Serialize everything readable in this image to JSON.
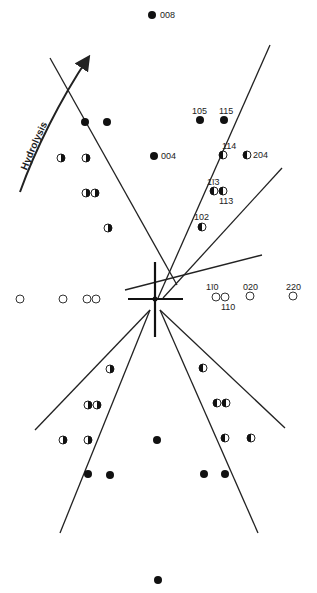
{
  "hydrolysis_label": "Hydrolysis",
  "center": [
    155,
    299
  ],
  "lines": [
    [
      50,
      58,
      177,
      285
    ],
    [
      125,
      290,
      262,
      255
    ],
    [
      270,
      45,
      158,
      298
    ],
    [
      163,
      298,
      282,
      168
    ],
    [
      35,
      430,
      150,
      310
    ],
    [
      60,
      533,
      150,
      310
    ],
    [
      160,
      310,
      258,
      533
    ],
    [
      160,
      310,
      285,
      428
    ]
  ],
  "cross": {
    "h": [
      128,
      299,
      183,
      299
    ],
    "v": [
      155,
      262,
      155,
      337
    ]
  },
  "arrow": {
    "path": "M20,192 C35,150 60,100 88,58",
    "tip": [
      88,
      58
    ]
  },
  "spots": [
    {
      "x": 152,
      "y": 15,
      "type": "full",
      "label": "008",
      "lx": 160,
      "ly": 18
    },
    {
      "x": 85,
      "y": 122,
      "type": "full"
    },
    {
      "x": 107,
      "y": 122,
      "type": "full"
    },
    {
      "x": 200,
      "y": 120,
      "type": "full",
      "label": "105",
      "lx": 192,
      "ly": 114
    },
    {
      "x": 224,
      "y": 120,
      "type": "full",
      "label": "115",
      "lx": 219,
      "ly": 114
    },
    {
      "x": 154,
      "y": 156,
      "type": "full",
      "label": "004",
      "lx": 161,
      "ly": 159
    },
    {
      "x": 61,
      "y": 158,
      "type": "halfR"
    },
    {
      "x": 86,
      "y": 158,
      "type": "halfR"
    },
    {
      "x": 223,
      "y": 155,
      "type": "halfL",
      "label": "114",
      "lx": 222,
      "ly": 149
    },
    {
      "x": 247,
      "y": 155,
      "type": "halfL",
      "label": "204",
      "lx": 253,
      "ly": 158
    },
    {
      "x": 86,
      "y": 193,
      "type": "halfR"
    },
    {
      "x": 95,
      "y": 193,
      "type": "halfR"
    },
    {
      "x": 214,
      "y": 191,
      "type": "halfL",
      "label": "1ī3",
      "lx": 207,
      "ly": 185
    },
    {
      "x": 223,
      "y": 191,
      "type": "halfL",
      "label": "113",
      "lx": 219,
      "ly": 204
    },
    {
      "x": 108,
      "y": 228,
      "type": "halfR"
    },
    {
      "x": 202,
      "y": 227,
      "type": "halfL",
      "label": "102",
      "lx": 194,
      "ly": 220
    },
    {
      "x": 20,
      "y": 299,
      "type": "open"
    },
    {
      "x": 63,
      "y": 299,
      "type": "open"
    },
    {
      "x": 87,
      "y": 299,
      "type": "open"
    },
    {
      "x": 96,
      "y": 299,
      "type": "open"
    },
    {
      "x": 216,
      "y": 297,
      "type": "open",
      "label": "1ī0",
      "lx": 206,
      "ly": 290
    },
    {
      "x": 225,
      "y": 297,
      "type": "open",
      "label": "110",
      "lx": 221,
      "ly": 310
    },
    {
      "x": 250,
      "y": 296,
      "type": "open",
      "label": "020",
      "lx": 243,
      "ly": 290
    },
    {
      "x": 293,
      "y": 296,
      "type": "open",
      "label": "220",
      "lx": 286,
      "ly": 290
    },
    {
      "x": 110,
      "y": 369,
      "type": "halfR"
    },
    {
      "x": 203,
      "y": 368,
      "type": "halfL"
    },
    {
      "x": 88,
      "y": 405,
      "type": "halfR"
    },
    {
      "x": 97,
      "y": 405,
      "type": "halfR"
    },
    {
      "x": 217,
      "y": 403,
      "type": "halfL"
    },
    {
      "x": 226,
      "y": 403,
      "type": "halfL"
    },
    {
      "x": 63,
      "y": 440,
      "type": "halfR"
    },
    {
      "x": 88,
      "y": 440,
      "type": "halfR"
    },
    {
      "x": 157,
      "y": 440,
      "type": "full"
    },
    {
      "x": 225,
      "y": 438,
      "type": "halfL"
    },
    {
      "x": 251,
      "y": 438,
      "type": "halfL"
    },
    {
      "x": 88,
      "y": 474,
      "type": "full"
    },
    {
      "x": 110,
      "y": 475,
      "type": "full"
    },
    {
      "x": 204,
      "y": 474,
      "type": "full"
    },
    {
      "x": 225,
      "y": 474,
      "type": "full"
    },
    {
      "x": 158,
      "y": 580,
      "type": "full"
    }
  ]
}
